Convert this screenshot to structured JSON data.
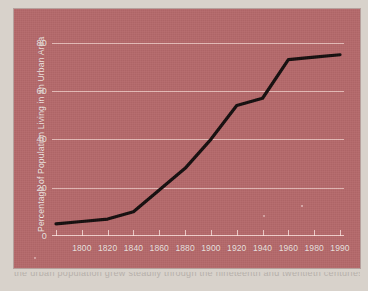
{
  "figure": {
    "background_color": "#b5696b",
    "gridline_color": "#ffe8e4",
    "line_color": "#140d0d",
    "tick_label_color": "#f2e4e1"
  },
  "caption": {
    "text": "the urban population grew steadily through the nineteenth and twentieth centuries"
  },
  "chart_data": {
    "type": "line",
    "title": "",
    "xlabel": "",
    "ylabel": "Percentage of Population Living in an Urban Area",
    "ylim": [
      0,
      84
    ],
    "yticks": [
      0,
      20,
      40,
      60,
      80
    ],
    "ytick_labels": [
      "0",
      "20",
      "40",
      "60",
      "80"
    ],
    "grid": true,
    "legend": false,
    "x_axis_type": "categorical",
    "x": [
      1790,
      1800,
      1820,
      1840,
      1860,
      1880,
      1900,
      1920,
      1940,
      1960,
      1980,
      1990
    ],
    "xtick_labels": [
      "",
      "1800",
      "1820",
      "1840",
      "1860",
      "1880",
      "1900",
      "1920",
      "1940",
      "1960",
      "1980",
      "1990"
    ],
    "series": [
      {
        "name": "Percentage of Population Living in an Urban Area",
        "values": [
          5,
          6,
          7,
          10,
          19,
          28,
          40,
          54,
          57,
          73,
          74,
          75
        ]
      }
    ]
  }
}
